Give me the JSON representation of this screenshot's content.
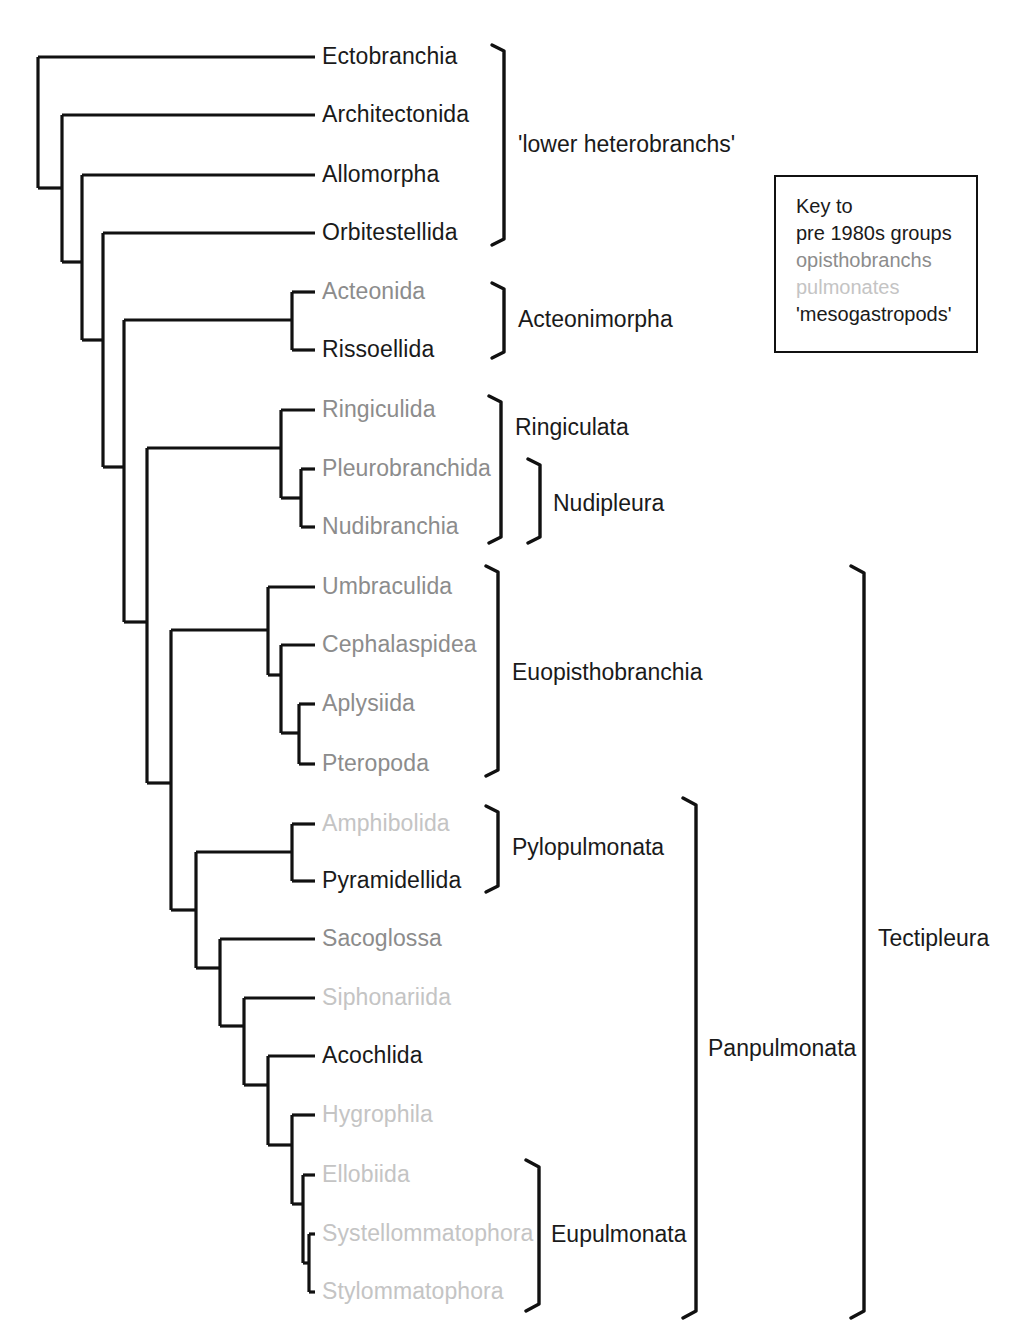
{
  "figure": {
    "type": "cladogram",
    "title": "",
    "background": "#ffffff",
    "colors": {
      "black": "#1a1a1a",
      "opisthobranchs_gray": "#8c8c8c",
      "pulmonates_lightgray": "#c4c4c4",
      "line": "#111111"
    }
  },
  "taxa": [
    {
      "name": "Ectobranchia",
      "group": "mesogastropods",
      "color": "#1a1a1a",
      "x": 322,
      "y": 57
    },
    {
      "name": "Architectonida",
      "group": "mesogastropods",
      "color": "#1a1a1a",
      "x": 322,
      "y": 115
    },
    {
      "name": "Allomorpha",
      "group": "mesogastropods",
      "color": "#1a1a1a",
      "x": 322,
      "y": 175
    },
    {
      "name": "Orbitestellida",
      "group": "mesogastropods",
      "color": "#1a1a1a",
      "x": 322,
      "y": 233
    },
    {
      "name": "Acteonida",
      "group": "opisthobranchs",
      "color": "#8c8c8c",
      "x": 322,
      "y": 292
    },
    {
      "name": "Rissoellida",
      "group": "mesogastropods",
      "color": "#1a1a1a",
      "x": 322,
      "y": 350
    },
    {
      "name": "Ringiculida",
      "group": "opisthobranchs",
      "color": "#8c8c8c",
      "x": 322,
      "y": 410
    },
    {
      "name": "Pleurobranchida",
      "group": "opisthobranchs",
      "color": "#8c8c8c",
      "x": 322,
      "y": 469
    },
    {
      "name": "Nudibranchia",
      "group": "opisthobranchs",
      "color": "#8c8c8c",
      "x": 322,
      "y": 527
    },
    {
      "name": "Umbraculida",
      "group": "opisthobranchs",
      "color": "#8c8c8c",
      "x": 322,
      "y": 587
    },
    {
      "name": "Cephalaspidea",
      "group": "opisthobranchs",
      "color": "#8c8c8c",
      "x": 322,
      "y": 645
    },
    {
      "name": "Aplysiida",
      "group": "opisthobranchs",
      "color": "#8c8c8c",
      "x": 322,
      "y": 704
    },
    {
      "name": "Pteropoda",
      "group": "opisthobranchs",
      "color": "#8c8c8c",
      "x": 322,
      "y": 764
    },
    {
      "name": "Amphibolida",
      "group": "pulmonates",
      "color": "#c4c4c4",
      "x": 322,
      "y": 824
    },
    {
      "name": "Pyramidellida",
      "group": "mesogastropods",
      "color": "#1a1a1a",
      "x": 322,
      "y": 881
    },
    {
      "name": "Sacoglossa",
      "group": "opisthobranchs",
      "color": "#8c8c8c",
      "x": 322,
      "y": 939
    },
    {
      "name": "Siphonariida",
      "group": "pulmonates",
      "color": "#c4c4c4",
      "x": 322,
      "y": 998
    },
    {
      "name": "Acochlida",
      "group": "mesogastropods",
      "color": "#1a1a1a",
      "x": 322,
      "y": 1056
    },
    {
      "name": "Hygrophila",
      "group": "pulmonates",
      "color": "#c4c4c4",
      "x": 322,
      "y": 1115
    },
    {
      "name": "Ellobiida",
      "group": "pulmonates",
      "color": "#c4c4c4",
      "x": 322,
      "y": 1175
    },
    {
      "name": "Systellommatophora",
      "group": "pulmonates",
      "color": "#c4c4c4",
      "x": 322,
      "y": 1234
    },
    {
      "name": "Stylommatophora",
      "group": "pulmonates",
      "color": "#c4c4c4",
      "x": 322,
      "y": 1292
    }
  ],
  "clades": [
    {
      "name": "'lower heterobranchs'",
      "label_x": 518,
      "label_y": 145,
      "bracket_x": 492,
      "bracket_top": 45,
      "bracket_bottom": 245
    },
    {
      "name": "Acteonimorpha",
      "label_x": 518,
      "label_y": 320,
      "bracket_x": 492,
      "bracket_top": 283,
      "bracket_bottom": 358
    },
    {
      "name": "Ringiculata",
      "label_x": 515,
      "label_y": 428,
      "bracket_x": 489,
      "bracket_top": 396,
      "bracket_bottom": 543
    },
    {
      "name": "Nudipleura",
      "label_x": 553,
      "label_y": 504,
      "bracket_x": 528,
      "bracket_top": 459,
      "bracket_bottom": 543
    },
    {
      "name": "Euopisthobranchia",
      "label_x": 512,
      "label_y": 673,
      "bracket_x": 486,
      "bracket_top": 566,
      "bracket_bottom": 776
    },
    {
      "name": "Pylopulmonata",
      "label_x": 512,
      "label_y": 848,
      "bracket_x": 486,
      "bracket_top": 806,
      "bracket_bottom": 892
    },
    {
      "name": "Eupulmonata",
      "label_x": 551,
      "label_y": 1235,
      "bracket_x": 526,
      "bracket_top": 1160,
      "bracket_bottom": 1311
    },
    {
      "name": "Panpulmonata",
      "label_x": 708,
      "label_y": 1049,
      "bracket_x": 683,
      "bracket_top": 798,
      "bracket_bottom": 1318
    },
    {
      "name": "Tectipleura",
      "label_x": 878,
      "label_y": 939,
      "bracket_x": 851,
      "bracket_top": 566,
      "bracket_bottom": 1318
    }
  ],
  "key": {
    "box": {
      "x": 774,
      "y": 175,
      "width": 204,
      "height": 178
    },
    "lines": [
      {
        "text": "Key to",
        "color": "#1a1a1a"
      },
      {
        "text": "pre 1980s groups",
        "color": "#1a1a1a"
      },
      {
        "text": "opisthobranchs",
        "color": "#8c8c8c"
      },
      {
        "text": "pulmonates",
        "color": "#c4c4c4"
      },
      {
        "text": "'mesogastropods'",
        "color": "#1a1a1a"
      }
    ]
  },
  "tree_geometry": {
    "tip_x": 315,
    "stroke_width": 3.2,
    "nodes": [
      {
        "id": "root",
        "x": 38,
        "top": 57,
        "bottom": 188
      },
      {
        "id": "n1",
        "x": 62,
        "top": 115,
        "bottom": 188
      },
      {
        "id": "n2",
        "x": 82,
        "top": 175,
        "bottom": 262
      },
      {
        "id": "n3",
        "x": 103,
        "top": 233,
        "bottom": 340
      },
      {
        "id": "n4",
        "x": 124,
        "top": 320,
        "bottom": 467
      },
      {
        "id": "n5",
        "x": 147,
        "top": 448,
        "bottom": 622
      },
      {
        "id": "n6",
        "x": 171,
        "top": 630,
        "bottom": 783
      },
      {
        "id": "n7",
        "x": 196,
        "top": 852,
        "bottom": 910
      },
      {
        "id": "n8",
        "x": 196,
        "top": 910,
        "bottom": 968
      },
      {
        "id": "n9",
        "x": 220,
        "top": 968,
        "bottom": 1026
      },
      {
        "id": "n10",
        "x": 244,
        "top": 1026,
        "bottom": 1085
      },
      {
        "id": "n11",
        "x": 268,
        "top": 1085,
        "bottom": 1145
      },
      {
        "id": "n12",
        "x": 292,
        "top": 1145,
        "bottom": 1263
      },
      {
        "id": "n13",
        "x": 303,
        "top": 1234,
        "bottom": 1292
      }
    ]
  }
}
